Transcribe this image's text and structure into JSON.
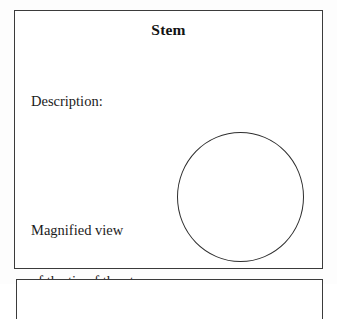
{
  "document": {
    "type": "worksheet-form",
    "background_color": "#fdfdfd",
    "ink_color": "#1b1b1b",
    "border_color": "#3b3b3b"
  },
  "panel": {
    "title": "Stem",
    "fields": {
      "description": {
        "label": "Description:"
      },
      "magnified_view": {
        "line1": "Magnified view",
        "line2": "of the tip of the stem:"
      }
    },
    "drawing_area": {
      "shape_name": "circle-outline",
      "stroke_color": "#2e2e2e",
      "filled": false,
      "content": ""
    }
  },
  "next_panel": {
    "note": ""
  }
}
